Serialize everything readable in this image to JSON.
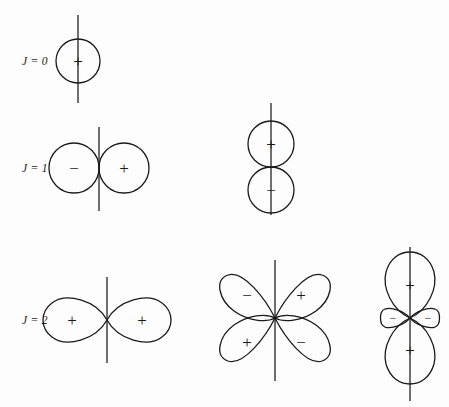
{
  "figure": {
    "background_color": "#fdfdfd",
    "stroke_color": "#1a1a1a",
    "width": 449,
    "height": 407,
    "rows": [
      {
        "id": "row-j0",
        "label": "J = 0",
        "label_x": 22,
        "label_y": 61
      },
      {
        "id": "row-j1",
        "label": "J = 1",
        "label_x": 22,
        "label_y": 168
      },
      {
        "id": "row-j2",
        "label": "J = 2",
        "label_x": 22,
        "label_y": 320
      }
    ],
    "diagrams": [
      {
        "id": "j0-monopole",
        "row": "J = 0",
        "kind": "single-circle",
        "center_x": 78,
        "center_y": 61,
        "radius": 22,
        "axis_top": 15,
        "axis_bottom": 103,
        "lobes": [
          {
            "sign": "+",
            "x": 78,
            "y": 61
          }
        ]
      },
      {
        "id": "j1-horizontal-dipole",
        "row": "J = 1",
        "kind": "two-circles-horizontal",
        "center_x": 99,
        "center_y": 168,
        "radius": 25,
        "axis_top": 127,
        "axis_bottom": 211,
        "lobes": [
          {
            "sign": "−",
            "x": 74,
            "y": 168
          },
          {
            "sign": "+",
            "x": 124,
            "y": 168
          }
        ]
      },
      {
        "id": "j1-vertical-dipole",
        "row": "J = 1",
        "kind": "two-circles-vertical",
        "center_x": 271,
        "center_y": 167,
        "radius": 23,
        "axis_top": 103,
        "axis_bottom": 215,
        "lobes": [
          {
            "sign": "+",
            "x": 271,
            "y": 144
          },
          {
            "sign": "−",
            "x": 271,
            "y": 190
          }
        ]
      },
      {
        "id": "j2-horizontal-quadrupole",
        "row": "J = 2",
        "kind": "two-lobes-horizontal",
        "center_x": 107,
        "center_y": 320,
        "lobe_length": 58,
        "lobe_width": 22,
        "axis_top": 277,
        "axis_bottom": 363,
        "lobes": [
          {
            "sign": "+",
            "x": 72,
            "y": 320
          },
          {
            "sign": "+",
            "x": 142,
            "y": 320
          }
        ]
      },
      {
        "id": "j2-cloverleaf-quadrupole",
        "row": "J = 2",
        "kind": "four-lobes-diagonal",
        "center_x": 275,
        "center_y": 318,
        "lobe_length": 52,
        "lobe_width": 24,
        "axis_top": 260,
        "axis_bottom": 381,
        "lobes": [
          {
            "sign": "−",
            "x": 247,
            "y": 295
          },
          {
            "sign": "+",
            "x": 301,
            "y": 295
          },
          {
            "sign": "+",
            "x": 247,
            "y": 342
          },
          {
            "sign": "−",
            "x": 301,
            "y": 342
          }
        ]
      },
      {
        "id": "j2-dz2-quadrupole",
        "row": "J = 2",
        "kind": "two-vertical-lobes-with-torus",
        "center_x": 410,
        "center_y": 318,
        "lobe_length": 60,
        "lobe_width": 25,
        "small_lobe_length": 22,
        "small_lobe_width": 9,
        "axis_top": 247,
        "axis_bottom": 401,
        "lobes": [
          {
            "sign": "+",
            "x": 410,
            "y": 285
          },
          {
            "sign": "+",
            "x": 410,
            "y": 350
          },
          {
            "sign": "−",
            "x": 391,
            "y": 318
          },
          {
            "sign": "−",
            "x": 429,
            "y": 318
          }
        ]
      }
    ]
  }
}
